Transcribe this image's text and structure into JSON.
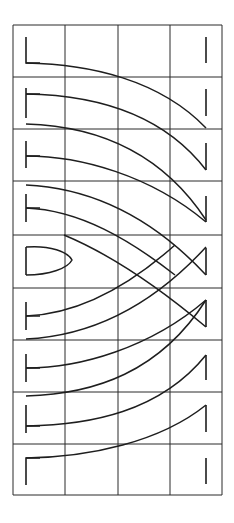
{
  "diagram": {
    "width": 234,
    "height": 523,
    "grid": {
      "x": [
        13,
        65,
        118,
        170,
        222
      ],
      "y": [
        25,
        77,
        129,
        181,
        235,
        288,
        340,
        392,
        444,
        495
      ],
      "color": "#2a2a2a"
    },
    "line_color": "#1e1e1e",
    "left_markers": [
      {
        "row": 0,
        "shape": "L",
        "x": 26,
        "y1": 37,
        "y2": 63
      },
      {
        "row": 1,
        "shape": "T",
        "x": 26,
        "y1": 88,
        "y2": 118,
        "arm_y": 94
      },
      {
        "row": 2,
        "shape": "T",
        "x": 26,
        "y1": 141,
        "y2": 168,
        "arm_y": 156
      },
      {
        "row": 3,
        "shape": "T",
        "x": 26,
        "y1": 194,
        "y2": 222,
        "arm_y": 208
      },
      {
        "row": 4,
        "shape": "D",
        "x": 26,
        "y1": 247,
        "y2": 275
      },
      {
        "row": 5,
        "shape": "T",
        "x": 26,
        "y1": 302,
        "y2": 330,
        "arm_y": 316
      },
      {
        "row": 6,
        "shape": "T",
        "x": 26,
        "y1": 354,
        "y2": 382,
        "arm_y": 368
      },
      {
        "row": 7,
        "shape": "T",
        "x": 26,
        "y1": 405,
        "y2": 433,
        "arm_y": 426
      },
      {
        "row": 8,
        "shape": "L",
        "x": 26,
        "y1": 458,
        "y2": 485
      }
    ],
    "right_markers": [
      {
        "row": 0,
        "x": 206,
        "y1": 37,
        "y2": 63
      },
      {
        "row": 1,
        "x": 206,
        "y1": 89,
        "y2": 116
      },
      {
        "row": 2,
        "x": 206,
        "y1": 143,
        "y2": 170
      },
      {
        "row": 3,
        "x": 206,
        "y1": 196,
        "y2": 222
      },
      {
        "row": 4,
        "x": 206,
        "y1": 248,
        "y2": 275
      },
      {
        "row": 5,
        "x": 206,
        "y1": 300,
        "y2": 327
      },
      {
        "row": 6,
        "x": 206,
        "y1": 355,
        "y2": 380
      },
      {
        "row": 7,
        "x": 206,
        "y1": 405,
        "y2": 432
      },
      {
        "row": 8,
        "x": 206,
        "y1": 458,
        "y2": 484
      }
    ],
    "curves": [
      "M26,63 C90,64 160,80 206,128",
      "M26,94 C90,95 160,110 206,170",
      "M26,124 C95,126 160,150 206,220",
      "M26,156 C80,156 150,175 206,222",
      "M26,185 C90,188 150,215 206,275",
      "M26,208 C80,210 130,240 175,275",
      "M26,247 C50,245 68,252 72,260 C68,268 50,275 26,275",
      "M64,235 C100,250 150,280 206,327",
      "M26,316 C80,314 130,285 175,245",
      "M26,339 C90,336 150,308 206,247",
      "M26,368 C80,368 150,348 206,300",
      "M26,396 C95,394 160,372 206,300",
      "M26,426 C90,425 160,412 206,355",
      "M26,458 C90,457 160,442 206,405"
    ]
  }
}
